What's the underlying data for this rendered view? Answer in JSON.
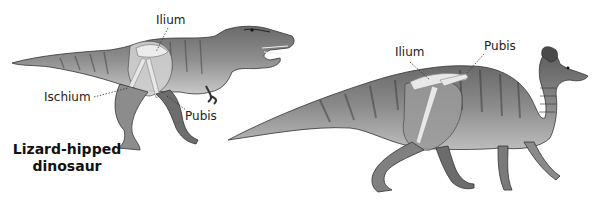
{
  "figure": {
    "left_dinosaur": {
      "animal": "tyrannosaurus",
      "caption_line1": "Lizard-hipped",
      "caption_line2": "dinosaur",
      "labels": {
        "ilium": "Ilium",
        "ischium": "Ischium",
        "pubis": "Pubis"
      }
    },
    "right_dinosaur": {
      "animal": "hadrosaur",
      "labels": {
        "ilium": "Ilium",
        "pubis": "Pubis"
      }
    }
  }
}
